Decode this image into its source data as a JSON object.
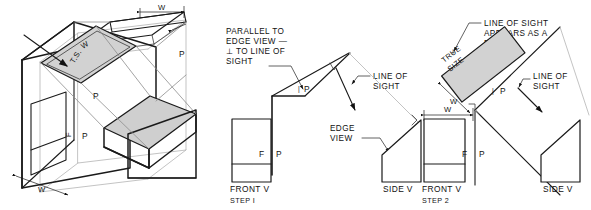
{
  "figure": {
    "background_color": "#ffffff",
    "line_color": "#1a1a1a",
    "shade_color": "#d2d2d2",
    "light_line_color": "#b4b4b4"
  },
  "pictorial": {
    "name": "isometric-pictorial",
    "labels": {
      "true_size_ts": "T.S.",
      "width_on_aux": "W",
      "p_fold_top": "P",
      "p_fold_mid": "P",
      "p_fold_lower": "P",
      "f_fold": "F",
      "w_top": "W",
      "w_bottom": "W",
      "f_vertical": "F"
    }
  },
  "step1": {
    "name": "step-1-diagram",
    "note_parallel": {
      "line1": "PARALLEL TO",
      "line2": "EDGE VIEW —",
      "line3": "⊥ TO LINE OF",
      "line4": "SIGHT"
    },
    "note_line_of_sight": {
      "line1": "LINE OF",
      "line2": "SIGHT"
    },
    "note_edge_view": {
      "line1": "EDGE",
      "line2": "VIEW"
    },
    "fold_f": "F",
    "fold_p": "P",
    "fold_p_upper": "P",
    "front_view_label": "FRONT V",
    "side_view_label": "SIDE V",
    "step_label": "STEP I"
  },
  "step2": {
    "name": "step-2-diagram",
    "note_point": {
      "line1": "LINE OF SIGHT",
      "line2": "APPEARS AS A",
      "line3": "POINT"
    },
    "note_line_of_sight": {
      "line1": "LINE OF",
      "line2": "SIGHT"
    },
    "true_size_label": {
      "line1": "TRUE",
      "line2": "SIZE"
    },
    "dim_w_aux": "W",
    "dim_w_front": "W",
    "fold_f": "F",
    "fold_p": "P",
    "fold_p_upper": "P",
    "front_view_label": "FRONT V",
    "side_view_label": "SIDE V",
    "step_label": "STEP 2"
  }
}
